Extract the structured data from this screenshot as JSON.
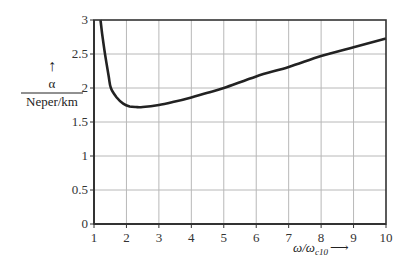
{
  "chart_data": {
    "type": "line",
    "title": "",
    "xlabel": "ω/ω_c10 →",
    "xlabel_main": "ω/ω",
    "xlabel_sub": "c10",
    "xlabel_arrow": "⟶",
    "ylabel": "α / (Neper/km)",
    "ylabel_arrow": "↑",
    "ylabel_numerator": "α",
    "ylabel_denominator": "Neper/km",
    "xlim": [
      1,
      10
    ],
    "ylim": [
      0,
      3
    ],
    "grid": true,
    "legend": null,
    "x_ticks": [
      "1",
      "2",
      "3",
      "4",
      "5",
      "6",
      "7",
      "8",
      "9",
      "10"
    ],
    "y_ticks": [
      "0",
      "0.5",
      "1",
      "1.5",
      "2",
      "2.5",
      "3"
    ],
    "series": [
      {
        "name": "alpha",
        "x": [
          1.2,
          1.25,
          1.34,
          1.45,
          1.52,
          1.7,
          1.9,
          2.1,
          2.3,
          2.5,
          3,
          3.5,
          4,
          4.5,
          5,
          6,
          7,
          8,
          9,
          10
        ],
        "values": [
          3.0,
          2.8,
          2.5,
          2.18,
          2.0,
          1.86,
          1.77,
          1.73,
          1.72,
          1.72,
          1.75,
          1.8,
          1.86,
          1.93,
          2.0,
          2.17,
          2.31,
          2.47,
          2.6,
          2.73
        ]
      }
    ]
  }
}
